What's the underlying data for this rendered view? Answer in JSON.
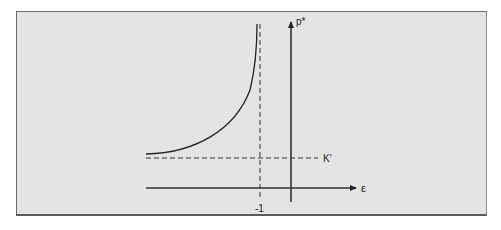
{
  "diagram": {
    "type": "function-plot-schematic",
    "background_color": "#e4e4e4",
    "border_color": "#6a6a6a",
    "line_color": "#222222",
    "y_axis": {
      "label": "p*"
    },
    "x_axis": {
      "label": "ε"
    },
    "asymptote_vertical": {
      "label": "-1",
      "style": "dashed"
    },
    "asymptote_horizontal": {
      "label": "K'",
      "style": "dashed"
    },
    "curve": {
      "description": "convex increasing curve approaching vertical asymptote at ε = -1 from the left, approaching K' as ε decreases"
    }
  }
}
